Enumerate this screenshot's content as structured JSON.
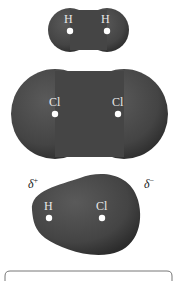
{
  "molecules": [
    {
      "name": "H2",
      "atoms": [
        {
          "label": "H"
        },
        {
          "label": "H"
        }
      ]
    },
    {
      "name": "Cl2",
      "atoms": [
        {
          "label": "Cl"
        },
        {
          "label": "Cl"
        }
      ]
    },
    {
      "name": "HCl",
      "atoms": [
        {
          "label": "H"
        },
        {
          "label": "Cl"
        }
      ],
      "partial_charges": {
        "left": "δ",
        "left_sign": "+",
        "right": "δ",
        "right_sign": "−"
      }
    }
  ],
  "colors": {
    "surface": "#4a4a4a",
    "surface_dark": "#2e2e2e",
    "atom_dot": "#ffffff",
    "bracket": "#777777"
  }
}
